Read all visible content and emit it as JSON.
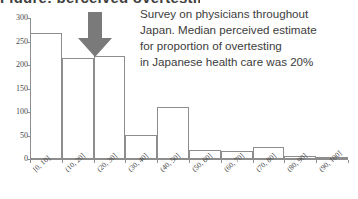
{
  "title_sliver": "Figure: perceived overtesting",
  "annotation": {
    "arrow_icon": "down-arrow-icon",
    "arrow_color": "#7a7a7a",
    "points_to_category": "(20, 30]"
  },
  "note": {
    "lines": [
      "Survey on physicians throughout",
      "Japan. Median perceived estimate",
      "for proportion of overtesting",
      "in Japanese health care was 20%"
    ],
    "highlight_value": "20%"
  },
  "chart_data": {
    "type": "bar",
    "title": "",
    "xlabel": "",
    "ylabel": "",
    "categories": [
      "[0, 10]",
      "(10, 20]",
      "(20, 30]",
      "(30, 40]",
      "(40, 50]",
      "(50, 60]",
      "(60, 70]",
      "(70, 80]",
      "(80, 90]",
      "(90, 100]"
    ],
    "values": [
      268,
      215,
      219,
      51,
      111,
      20,
      16,
      25,
      6,
      2
    ],
    "ylim": [
      0,
      300
    ],
    "yticks": [
      0,
      50,
      100,
      150,
      200,
      250,
      300
    ],
    "ytick_labels": [
      "0",
      "50",
      "100",
      "150",
      "200",
      "250",
      "300"
    ],
    "grid": false,
    "legend": "none",
    "bar_fill": "#ffffff",
    "bar_stroke": "#8d8d8d",
    "axis_color": "#8d8d8d"
  }
}
